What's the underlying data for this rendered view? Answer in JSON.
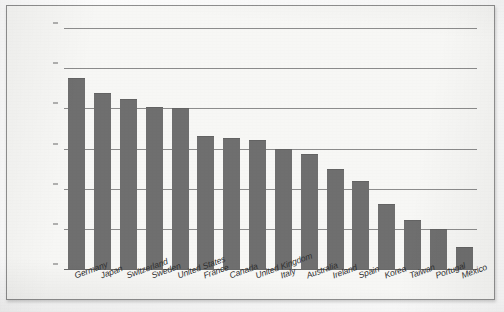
{
  "chart_data": {
    "type": "bar",
    "title": "",
    "subtitle": "",
    "xlabel": "",
    "ylabel": "",
    "ylim": [
      0,
      30
    ],
    "grid": true,
    "legend": false,
    "legend_position": "none",
    "orientation": "vertical",
    "bar_color": "#6f6f6f",
    "plot_background": "#f7f7f5",
    "axis_tick_prefix": "$",
    "categories": [
      "Germany",
      "Japan",
      "Switzerland",
      "Sweden",
      "United States",
      "France",
      "Canada",
      "United Kingdom",
      "Italy",
      "Australia",
      "Ireland",
      "Spain",
      "Korea",
      "Taiwan",
      "Portugal",
      "Mexico"
    ],
    "values": [
      23.8,
      21.9,
      21.2,
      20.2,
      20.0,
      16.5,
      16.3,
      16.0,
      14.9,
      14.3,
      12.5,
      11.0,
      8.1,
      6.1,
      5.0,
      2.7
    ],
    "ytick_values": [
      0,
      5,
      10,
      15,
      20,
      25,
      30
    ],
    "ytick_labels": [
      "$0",
      "$5",
      "$10",
      "$15",
      "$20",
      "$25",
      "$30"
    ]
  }
}
